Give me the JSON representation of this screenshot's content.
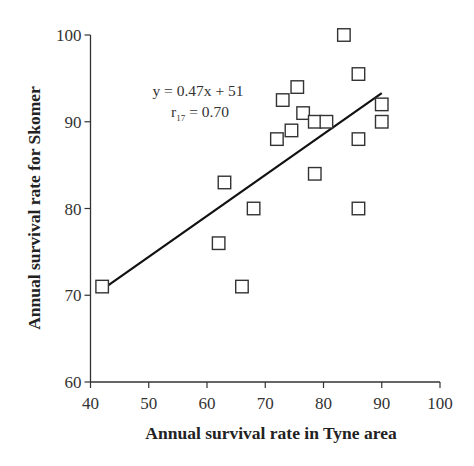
{
  "chart_data": {
    "type": "scatter",
    "title": "",
    "xlabel": "Annual survival rate in Tyne area",
    "ylabel": "Annual survival rate for Skomer",
    "xlim": [
      40,
      100
    ],
    "ylim": [
      60,
      100
    ],
    "xticks": [
      40,
      50,
      60,
      70,
      80,
      90,
      100
    ],
    "yticks": [
      60,
      70,
      80,
      90,
      100
    ],
    "grid": false,
    "legend": null,
    "marker": "open-square",
    "series": [
      {
        "name": "Years",
        "points": [
          {
            "x": 42,
            "y": 71
          },
          {
            "x": 62,
            "y": 76
          },
          {
            "x": 63,
            "y": 83
          },
          {
            "x": 66,
            "y": 71
          },
          {
            "x": 68,
            "y": 80
          },
          {
            "x": 72,
            "y": 88
          },
          {
            "x": 73,
            "y": 92.5
          },
          {
            "x": 74.5,
            "y": 89
          },
          {
            "x": 75.5,
            "y": 94
          },
          {
            "x": 76.5,
            "y": 91
          },
          {
            "x": 78.5,
            "y": 90
          },
          {
            "x": 78.5,
            "y": 84
          },
          {
            "x": 80.5,
            "y": 90
          },
          {
            "x": 83.5,
            "y": 100
          },
          {
            "x": 86,
            "y": 95.5
          },
          {
            "x": 86,
            "y": 88
          },
          {
            "x": 86,
            "y": 80
          },
          {
            "x": 90,
            "y": 92
          },
          {
            "x": 90,
            "y": 90
          }
        ]
      }
    ],
    "regression": {
      "slope": 0.47,
      "intercept": 51,
      "x_range": [
        42,
        90
      ],
      "equation_label": "y = 0.47x + 51",
      "r_label_main": "r",
      "r_label_sub": "17",
      "r_label_value": " = 0.70"
    },
    "annotations": [
      "y = 0.47x + 51",
      "r17 = 0.70"
    ]
  }
}
